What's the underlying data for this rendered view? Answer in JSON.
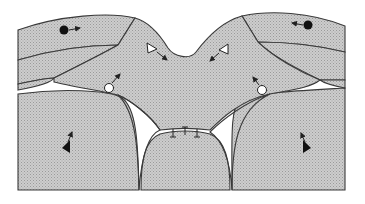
{
  "figure": {
    "colors": {
      "background": "#ffffff",
      "region_fill": "#c8c8c8",
      "stipple": "#a8a8a8",
      "outline": "#3a3a3a",
      "marker_dark": "#111111",
      "marker_open": "#ffffff"
    },
    "regions": [
      {
        "id": "top-left-cap",
        "marker": "filled-circle",
        "arrow_direction": "right"
      },
      {
        "id": "top-right-cap",
        "marker": "filled-circle",
        "arrow_direction": "left"
      },
      {
        "id": "central-lobe",
        "markers": [
          "open-triangle",
          "open-triangle",
          "open-circle",
          "open-circle"
        ]
      },
      {
        "id": "bottom-left-lobe",
        "marker": "filled-arrowhead",
        "arrow_direction": "up"
      },
      {
        "id": "bottom-right-lobe",
        "marker": "filled-arrowhead",
        "arrow_direction": "up"
      },
      {
        "id": "bottom-center-lobe",
        "marker": "junction-bars",
        "count": 3
      }
    ],
    "labels": []
  }
}
